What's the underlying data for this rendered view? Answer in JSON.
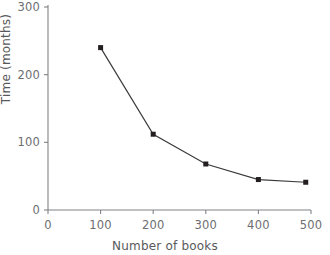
{
  "chart_data": {
    "type": "line",
    "title": "",
    "xlabel": "Number of books",
    "ylabel": "Time (months)",
    "xlim": [
      0,
      500
    ],
    "ylim": [
      0,
      300
    ],
    "xticks": [
      0,
      100,
      200,
      300,
      400,
      500
    ],
    "yticks": [
      0,
      100,
      200,
      300
    ],
    "xtick_labels": [
      "0",
      "100",
      "200",
      "300",
      "400",
      "500"
    ],
    "ytick_labels": [
      "0",
      "100",
      "200",
      "300"
    ],
    "grid": false,
    "legend": false,
    "marker": "square",
    "marker_color": "#231f20",
    "line_color": "#3b3b3b",
    "axis_color": "#808285",
    "text_color": "#6d6e71",
    "background": "#ffffff",
    "x": [
      100,
      200,
      300,
      400,
      490
    ],
    "values": [
      240,
      112,
      68,
      45,
      41
    ],
    "series": [
      {
        "name": "Time vs number of books",
        "points": [
          {
            "x": 100,
            "y": 240
          },
          {
            "x": 200,
            "y": 112
          },
          {
            "x": 300,
            "y": 68
          },
          {
            "x": 400,
            "y": 45
          },
          {
            "x": 490,
            "y": 41
          }
        ]
      }
    ]
  }
}
